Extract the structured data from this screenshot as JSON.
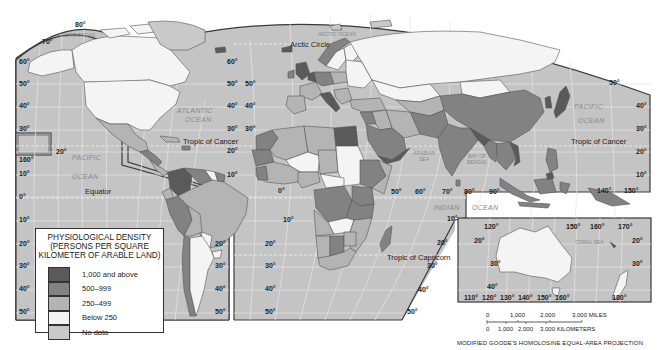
{
  "map": {
    "title": "Physiological Density",
    "projection": "MODIFIED GOODE'S HOMOLOSINE EQUAL-AREA PROJECTION",
    "colors": {
      "ocean": "#c4c4c4",
      "grid": "#e8e8e8",
      "border": "#444444",
      "class_1000_above": "#5a5a5a",
      "class_500_999": "#828282",
      "class_250_499": "#b4b4b4",
      "class_below_250": "#f4f4f4",
      "class_no_data": "#c9c9c9"
    },
    "ocean_labels": [
      {
        "text": "ARCTIC OCEAN",
        "x": 75,
        "y": 37
      },
      {
        "text": "ARCTIC OCEAN",
        "x": 338,
        "y": 35
      },
      {
        "text": "ATLANTIC",
        "x": 177,
        "y": 112
      },
      {
        "text": "OCEAN",
        "x": 185,
        "y": 121
      },
      {
        "text": "PACIFIC",
        "x": 73,
        "y": 160
      },
      {
        "text": "OCEAN",
        "x": 73,
        "y": 178
      },
      {
        "text": "PACIFIC",
        "x": 574,
        "y": 108
      },
      {
        "text": "OCEAN",
        "x": 578,
        "y": 122
      },
      {
        "text": "INDIAN",
        "x": 437,
        "y": 210
      },
      {
        "text": "OCEAN",
        "x": 472,
        "y": 210
      },
      {
        "text": "ARABIAN",
        "x": 415,
        "y": 155
      },
      {
        "text": "SEA",
        "x": 420,
        "y": 161
      },
      {
        "text": "BAY OF",
        "x": 470,
        "y": 158
      },
      {
        "text": "BENGAL",
        "x": 469,
        "y": 164
      },
      {
        "text": "CORAL SEA",
        "x": 570,
        "y": 254
      }
    ],
    "line_labels": [
      {
        "text": "Arctic Circle",
        "x": 290,
        "y": 46
      },
      {
        "text": "Tropic of Cancer",
        "x": 183,
        "y": 143
      },
      {
        "text": "Tropic of Cancer",
        "x": 571,
        "y": 143
      },
      {
        "text": "Equator",
        "x": 85,
        "y": 194
      },
      {
        "text": "Tropic of Capricorn",
        "x": 387,
        "y": 263
      }
    ],
    "lat_labels": [
      {
        "text": "80°",
        "x": 73,
        "y": 27
      },
      {
        "text": "70°",
        "x": 42,
        "y": 43
      },
      {
        "text": "60°",
        "x": 19,
        "y": 62
      },
      {
        "text": "50°",
        "x": 18,
        "y": 84
      },
      {
        "text": "40°",
        "x": 18,
        "y": 106
      },
      {
        "text": "30°",
        "x": 18,
        "y": 130
      },
      {
        "text": "160°",
        "x": 17,
        "y": 162
      },
      {
        "text": "20°",
        "x": 56,
        "y": 153
      },
      {
        "text": "10°",
        "x": 18,
        "y": 173
      },
      {
        "text": "0°",
        "x": 18,
        "y": 199
      },
      {
        "text": "10°",
        "x": 18,
        "y": 222
      },
      {
        "text": "20°",
        "x": 18,
        "y": 244
      },
      {
        "text": "30°",
        "x": 18,
        "y": 266
      },
      {
        "text": "40°",
        "x": 18,
        "y": 289
      },
      {
        "text": "50°",
        "x": 18,
        "y": 313
      },
      {
        "text": "60°",
        "x": 227,
        "y": 63
      },
      {
        "text": "50°",
        "x": 227,
        "y": 84
      },
      {
        "text": "40°",
        "x": 227,
        "y": 107
      },
      {
        "text": "30°",
        "x": 227,
        "y": 130
      },
      {
        "text": "20°",
        "x": 227,
        "y": 152
      },
      {
        "text": "10°",
        "x": 227,
        "y": 177
      },
      {
        "text": "50°",
        "x": 245,
        "y": 84
      },
      {
        "text": "40°",
        "x": 245,
        "y": 107
      },
      {
        "text": "30°",
        "x": 245,
        "y": 130
      },
      {
        "text": "0°",
        "x": 278,
        "y": 193
      },
      {
        "text": "10°",
        "x": 283,
        "y": 222
      },
      {
        "text": "20°",
        "x": 265,
        "y": 245
      },
      {
        "text": "30°",
        "x": 265,
        "y": 268
      },
      {
        "text": "40°",
        "x": 265,
        "y": 291
      },
      {
        "text": "50°",
        "x": 265,
        "y": 313
      },
      {
        "text": "20°",
        "x": 265,
        "y": 245
      },
      {
        "text": "20°",
        "x": 224,
        "y": 245
      },
      {
        "text": "30°",
        "x": 224,
        "y": 268
      },
      {
        "text": "40°",
        "x": 224,
        "y": 291
      },
      {
        "text": "50°",
        "x": 224,
        "y": 313
      },
      {
        "text": "50°",
        "x": 391,
        "y": 193
      },
      {
        "text": "60°",
        "x": 415,
        "y": 193
      },
      {
        "text": "70°",
        "x": 442,
        "y": 193
      },
      {
        "text": "80°",
        "x": 465,
        "y": 193
      },
      {
        "text": "90°",
        "x": 489,
        "y": 193
      },
      {
        "text": "10°",
        "x": 447,
        "y": 220
      },
      {
        "text": "20°",
        "x": 436,
        "y": 244
      },
      {
        "text": "30°",
        "x": 430,
        "y": 267
      },
      {
        "text": "40°",
        "x": 418,
        "y": 292
      },
      {
        "text": "50°",
        "x": 407,
        "y": 314
      },
      {
        "text": "20°",
        "x": 643,
        "y": 244
      },
      {
        "text": "50°",
        "x": 609,
        "y": 84
      },
      {
        "text": "40°",
        "x": 634,
        "y": 107
      },
      {
        "text": "30°",
        "x": 634,
        "y": 130
      },
      {
        "text": "20°",
        "x": 634,
        "y": 153
      },
      {
        "text": "10°",
        "x": 634,
        "y": 176
      },
      {
        "text": "140°",
        "x": 597,
        "y": 193
      },
      {
        "text": "150°",
        "x": 624,
        "y": 193
      }
    ],
    "inset": {
      "lon_top": [
        "120°",
        "150°",
        "160°",
        "170°"
      ],
      "lon_bottom": [
        "110°",
        "120°",
        "130°",
        "140°",
        "150°",
        "160°",
        "180°"
      ],
      "lat_left": [
        "20°",
        "30°",
        "40°"
      ],
      "lat_right": [
        "20°",
        "30°"
      ]
    }
  },
  "legend": {
    "title_line1": "PHYSIOLOGICAL DENSITY",
    "title_line2": "(PERSONS PER SQUARE",
    "title_line3": "KILOMETER OF ARABLE LAND)",
    "items": [
      {
        "label": "1,000 and above",
        "color": "#5a5a5a"
      },
      {
        "label": "500–999",
        "color": "#828282"
      },
      {
        "label": "250–499",
        "color": "#b4b4b4"
      },
      {
        "label": "Below 250",
        "color": "#f4f4f4"
      },
      {
        "label": "No data",
        "color": "#c9c9c9"
      }
    ]
  },
  "scale_bar": {
    "miles": [
      "0",
      "1,000",
      "2,000",
      "3,000 MILES"
    ],
    "kilometers": [
      "0",
      "1,000",
      "2,000",
      "3,000 KILOMETERS"
    ]
  }
}
